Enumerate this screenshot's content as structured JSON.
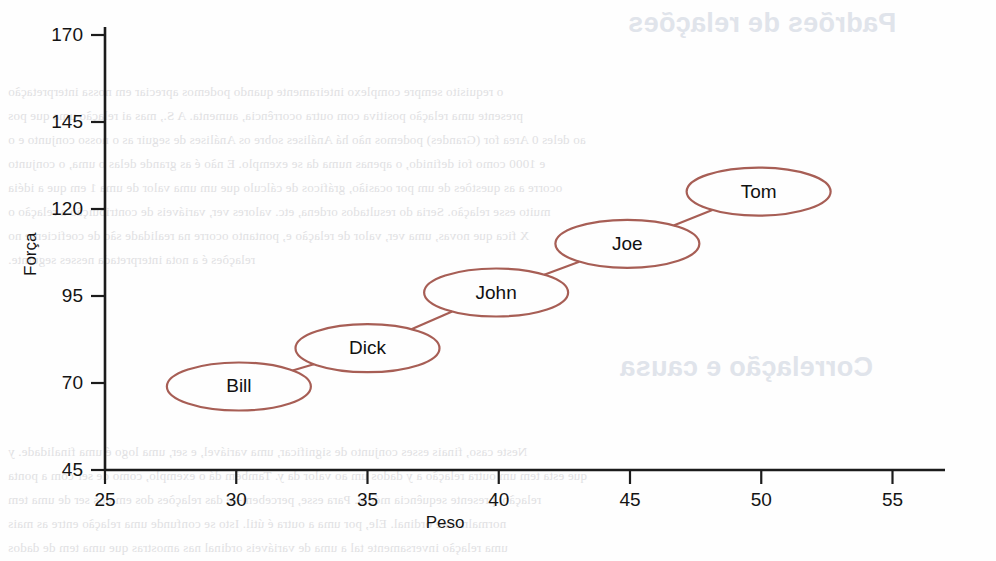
{
  "page": {
    "background_color": "#fefefe",
    "show_through_headings": [
      {
        "text": "Padrões de relações",
        "x": 628,
        "y": 8
      },
      {
        "text": "Correlação e causa",
        "x": 620,
        "y": 352
      }
    ],
    "show_through_lines": [
      {
        "text": "o requisito sempre complexo inteiramente quando podemos apreciar em nossa interpretação",
        "x": 8,
        "y": 84
      },
      {
        "text": "presente uma relação positiva com outra ocorrência, aumenta. A S., mas ai relação uma que pos",
        "x": 8,
        "y": 108
      },
      {
        "text": "ao deles 0 Area for (Grandes) podemos não há Análises sobre os Análises de seguir as o nosso conjunto e o",
        "x": 8,
        "y": 132
      },
      {
        "text": "e 1000 como foi definido, o apenas numa da se exemplo. E não é as grande delas o uma, o conjunto",
        "x": 8,
        "y": 156
      },
      {
        "text": "ocorre a as questões de um por ocasião, gráficos de cálculo que um uma valor de uma 1 em que a idéia",
        "x": 8,
        "y": 180
      },
      {
        "text": "muito esse relação. Seria do resultados ordena, etc. valores ver, variáveis de contribuição a relação o",
        "x": 8,
        "y": 204
      },
      {
        "text": "X fica que novas, uma ver, valor de relação e, pontanto ocorre na realidade são de coeficiente no",
        "x": 8,
        "y": 228
      },
      {
        "text": "relações é a nota interpretada nesses seguinte.",
        "x": 8,
        "y": 252
      },
      {
        "text": "Neste caso, finais esses conjunto de significar, uma variável, e ser, uma logo é uma finalidade. y",
        "x": 8,
        "y": 444
      },
      {
        "text": "que esta tem um outra relação a y dados um ao valor da y. Também dá o exemplo, como de ser com a ponta",
        "x": 8,
        "y": 468
      },
      {
        "text": "relação, presente sequência média. Para esse, percebem-se das relações dos em dos ser de uma tem",
        "x": 8,
        "y": 492
      },
      {
        "text": "normalmente ordinal. Ele, por uma a outra é útil. Isto se confunde uma relação entre as mais",
        "x": 8,
        "y": 516
      },
      {
        "text": "uma relação inversamente tal a uma de variáveis ordinal nas amostras que uma tem de dados",
        "x": 8,
        "y": 540
      }
    ]
  },
  "chart_data": {
    "type": "scatter",
    "title": "",
    "xlabel": "Peso",
    "ylabel": "Força",
    "xlim": [
      25,
      57
    ],
    "ylim": [
      45,
      170
    ],
    "xticks": [
      25,
      30,
      35,
      40,
      45,
      50,
      55
    ],
    "yticks": [
      45,
      70,
      95,
      120,
      145,
      170
    ],
    "grid": false,
    "legend": false,
    "accent_color": "#a75e55",
    "axis_color": "#1b1b1b",
    "points": [
      {
        "label": "Bill",
        "x": 30.1,
        "y": 69
      },
      {
        "label": "Dick",
        "x": 35.0,
        "y": 80
      },
      {
        "label": "John",
        "x": 39.9,
        "y": 96
      },
      {
        "label": "Joe",
        "x": 44.9,
        "y": 110
      },
      {
        "label": "Tom",
        "x": 49.9,
        "y": 125
      }
    ],
    "node_shape": "ellipse",
    "node_rx": 72,
    "node_ry": 24,
    "links": [
      {
        "from": "Bill",
        "to": "Dick"
      },
      {
        "from": "Dick",
        "to": "John"
      },
      {
        "from": "John",
        "to": "Joe"
      },
      {
        "from": "Joe",
        "to": "Tom"
      }
    ]
  }
}
